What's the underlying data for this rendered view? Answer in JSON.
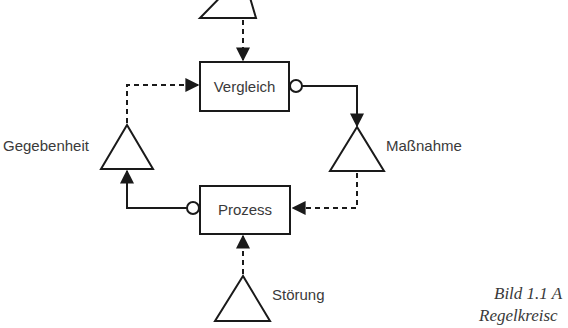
{
  "diagram": {
    "type": "control-loop",
    "nodes": {
      "vergleich": {
        "label": "Vergleich",
        "shape": "rectangle"
      },
      "prozess": {
        "label": "Prozess",
        "shape": "rectangle"
      },
      "massnahme": {
        "label": "Maßnahme",
        "shape": "triangle"
      },
      "gegebenheit": {
        "label": "Gegebenheit",
        "shape": "triangle"
      },
      "stoerung": {
        "label": "Störung",
        "shape": "triangle"
      },
      "top_input": {
        "label": "",
        "shape": "triangle"
      }
    },
    "edges": [
      {
        "from": "top_input",
        "to": "vergleich",
        "style": "dashed",
        "head": "arrow"
      },
      {
        "from": "vergleich",
        "to": "massnahme",
        "style": "solid",
        "tail": "open-circle",
        "head": "arrow"
      },
      {
        "from": "massnahme",
        "to": "prozess",
        "style": "dashed",
        "head": "arrow"
      },
      {
        "from": "prozess",
        "to": "gegebenheit",
        "style": "solid",
        "tail": "open-circle",
        "head": "arrow"
      },
      {
        "from": "gegebenheit",
        "to": "vergleich",
        "style": "dashed",
        "head": "arrow"
      },
      {
        "from": "stoerung",
        "to": "prozess",
        "style": "dashed",
        "head": "arrow"
      }
    ],
    "colors": {
      "stroke": "#1a1a1a",
      "text": "#3a3a3a",
      "background": "#ffffff"
    }
  },
  "caption": {
    "line1": "Bild 1.1 A",
    "line2": "Regelkreisc"
  }
}
